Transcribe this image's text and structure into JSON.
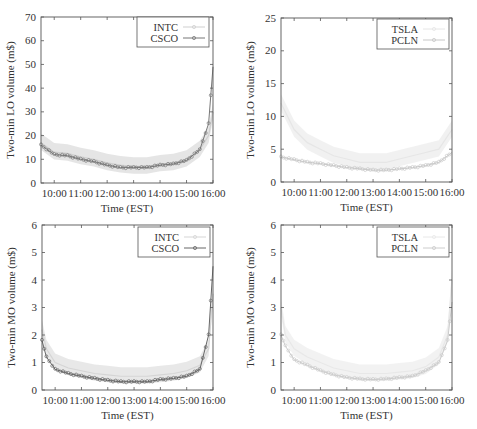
{
  "figure": {
    "x_tick_labels": [
      "10:00",
      "11:00",
      "12:00",
      "13:00",
      "14:00",
      "15:00",
      "16:00"
    ],
    "xlabel": "Time (EST)"
  },
  "chart_data": [
    {
      "id": "top-left",
      "type": "line",
      "title": "",
      "xlabel": "Time (EST)",
      "ylabel": "Two-min LO volume (m$)",
      "ylim": [
        0,
        70
      ],
      "xlim": [
        "09:30",
        "16:00"
      ],
      "y_ticks": [
        0,
        10,
        20,
        30,
        40,
        50,
        60,
        70
      ],
      "x_ticks": [
        "10:00",
        "11:00",
        "12:00",
        "13:00",
        "14:00",
        "15:00",
        "16:00"
      ],
      "grid": false,
      "legend_position": "upper right",
      "legend": [
        "INTC",
        "CSCO"
      ],
      "x": [
        "09:30",
        "10:00",
        "10:30",
        "11:00",
        "11:30",
        "12:00",
        "12:30",
        "13:00",
        "13:30",
        "14:00",
        "14:30",
        "15:00",
        "15:30",
        "15:50",
        "16:00"
      ],
      "series": [
        {
          "name": "INTC",
          "style": "light band",
          "color": "#cfcfcf",
          "values": [
            17,
            13,
            12.5,
            11,
            10,
            8.5,
            7.5,
            7,
            7,
            8,
            8.5,
            10,
            14,
            20,
            30
          ]
        },
        {
          "name": "CSCO",
          "style": "line with circle markers",
          "color": "#777777",
          "values": [
            16,
            12,
            11.5,
            10,
            9,
            7.5,
            6.5,
            6.5,
            6.5,
            7.5,
            8,
            9.5,
            14,
            25,
            49
          ]
        }
      ]
    },
    {
      "id": "top-right",
      "type": "line",
      "title": "",
      "xlabel": "Time (EST)",
      "ylabel": "Two-min LO volume (m$)",
      "ylim": [
        0,
        25
      ],
      "xlim": [
        "09:30",
        "16:00"
      ],
      "y_ticks": [
        0,
        5,
        10,
        15,
        20,
        25
      ],
      "x_ticks": [
        "10:00",
        "11:00",
        "12:00",
        "13:00",
        "14:00",
        "15:00",
        "16:00"
      ],
      "grid": false,
      "legend_position": "upper right",
      "legend": [
        "TSLA",
        "PCLN"
      ],
      "x": [
        "09:30",
        "10:00",
        "10:30",
        "11:00",
        "11:30",
        "12:00",
        "12:30",
        "13:00",
        "13:30",
        "14:00",
        "14:30",
        "15:00",
        "15:30",
        "16:00"
      ],
      "series": [
        {
          "name": "TSLA",
          "style": "very light band",
          "color": "#e6e6e6",
          "values": [
            12,
            8,
            6,
            5,
            4,
            3.5,
            3,
            3,
            3,
            3.5,
            4,
            4.5,
            5,
            8
          ]
        },
        {
          "name": "PCLN",
          "style": "light line with markers",
          "color": "#c8c8c8",
          "values": [
            3.8,
            3.4,
            3,
            2.8,
            2.5,
            2.2,
            2,
            1.8,
            1.8,
            2,
            2.2,
            2.5,
            3,
            4.5
          ]
        }
      ]
    },
    {
      "id": "bottom-left",
      "type": "line",
      "title": "",
      "xlabel": "Time (EST)",
      "ylabel": "Two-min MO volume (m$)",
      "ylim": [
        0,
        6
      ],
      "xlim": [
        "09:30",
        "16:00"
      ],
      "y_ticks": [
        0,
        1,
        2,
        3,
        4,
        5,
        6
      ],
      "x_ticks": [
        "10:00",
        "11:00",
        "12:00",
        "13:00",
        "14:00",
        "15:00",
        "16:00"
      ],
      "grid": false,
      "legend_position": "upper right",
      "legend": [
        "INTC",
        "CSCO"
      ],
      "x": [
        "09:30",
        "09:40",
        "10:00",
        "10:30",
        "11:00",
        "11:30",
        "12:00",
        "12:30",
        "13:00",
        "13:30",
        "14:00",
        "14:30",
        "15:00",
        "15:30",
        "15:50",
        "16:00"
      ],
      "series": [
        {
          "name": "INTC",
          "style": "light band",
          "color": "#d5d5d5",
          "values": [
            2.2,
            1.5,
            1.0,
            0.8,
            0.7,
            0.6,
            0.55,
            0.5,
            0.5,
            0.5,
            0.55,
            0.6,
            0.7,
            0.9,
            1.5,
            3.5
          ]
        },
        {
          "name": "CSCO",
          "style": "line with circle markers",
          "color": "#666666",
          "values": [
            1.8,
            1.2,
            0.75,
            0.6,
            0.5,
            0.42,
            0.35,
            0.3,
            0.3,
            0.3,
            0.38,
            0.42,
            0.5,
            0.75,
            2.0,
            4.5
          ]
        }
      ]
    },
    {
      "id": "bottom-right",
      "type": "line",
      "title": "",
      "xlabel": "Time (EST)",
      "ylabel": "Two-min MO volume (m$)",
      "ylim": [
        0,
        6
      ],
      "xlim": [
        "09:30",
        "16:00"
      ],
      "y_ticks": [
        0,
        1,
        2,
        3,
        4,
        5,
        6
      ],
      "x_ticks": [
        "10:00",
        "11:00",
        "12:00",
        "13:00",
        "14:00",
        "15:00",
        "16:00"
      ],
      "grid": false,
      "legend_position": "upper right",
      "legend": [
        "TSLA",
        "PCLN"
      ],
      "x": [
        "09:30",
        "09:40",
        "10:00",
        "10:30",
        "11:00",
        "11:30",
        "12:00",
        "12:30",
        "13:00",
        "13:30",
        "14:00",
        "14:30",
        "15:00",
        "15:30",
        "15:50",
        "16:00"
      ],
      "series": [
        {
          "name": "TSLA",
          "style": "very light band",
          "color": "#e8e8e8",
          "values": [
            3.0,
            2.0,
            1.5,
            1.2,
            1.0,
            0.8,
            0.7,
            0.6,
            0.6,
            0.6,
            0.65,
            0.7,
            0.85,
            1.2,
            2.0,
            4.0
          ]
        },
        {
          "name": "PCLN",
          "style": "light line with markers",
          "color": "#cccccc",
          "values": [
            2.0,
            1.6,
            1.1,
            0.9,
            0.7,
            0.55,
            0.45,
            0.4,
            0.38,
            0.4,
            0.45,
            0.5,
            0.7,
            1.0,
            1.8,
            3.2
          ]
        }
      ]
    }
  ]
}
